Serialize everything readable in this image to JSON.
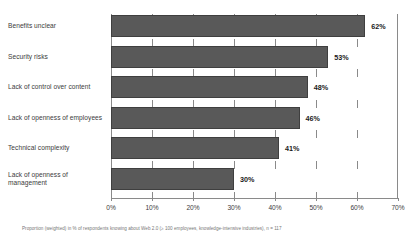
{
  "chart_data": {
    "type": "bar",
    "orientation": "horizontal",
    "title": "",
    "xlabel": "",
    "ylabel": "",
    "xlim": [
      0,
      70
    ],
    "grid": false,
    "legend": null,
    "categories": [
      "Benefits unclear",
      "Security risks",
      "Lack of control over content",
      "Lack of openness of employees",
      "Technical complexity",
      "Lack of openness of management"
    ],
    "values": [
      62,
      53,
      48,
      46,
      41,
      30
    ],
    "value_labels": [
      "62%",
      "53%",
      "48%",
      "46%",
      "41%",
      "30%"
    ],
    "tick_values": [
      0,
      10,
      20,
      30,
      40,
      50,
      60,
      70
    ],
    "tick_labels": [
      "0%",
      "10%",
      "20%",
      "30%",
      "40%",
      "50%",
      "60%",
      "70%"
    ],
    "bar_color": "#595959",
    "axis_color": "#8a8a8a",
    "text_color": "#3b3b3b"
  },
  "footnote": {
    "text": "Proportion (weighted) in % of respondents knowing about Web 2.0 (≥ 100 employees, knowledge-intensive industries), n = 117"
  }
}
